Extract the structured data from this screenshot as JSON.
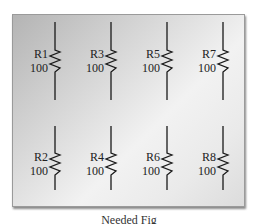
{
  "diagram": {
    "type": "circuit-schematic",
    "resistors": [
      {
        "id": "R1",
        "value": "100",
        "row": 0,
        "col": 0
      },
      {
        "id": "R3",
        "value": "100",
        "row": 0,
        "col": 1
      },
      {
        "id": "R5",
        "value": "100",
        "row": 0,
        "col": 2
      },
      {
        "id": "R7",
        "value": "100",
        "row": 0,
        "col": 3
      },
      {
        "id": "R2",
        "value": "100",
        "row": 1,
        "col": 0
      },
      {
        "id": "R4",
        "value": "100",
        "row": 1,
        "col": 1
      },
      {
        "id": "R6",
        "value": "100",
        "row": 1,
        "col": 2
      },
      {
        "id": "R8",
        "value": "100",
        "row": 1,
        "col": 3
      }
    ],
    "caption": "Needed Fig"
  },
  "labels": {
    "r1": "R1",
    "r1v": "100",
    "r3": "R3",
    "r3v": "100",
    "r5": "R5",
    "r5v": "100",
    "r7": "R7",
    "r7v": "100",
    "r2": "R2",
    "r2v": "100",
    "r4": "R4",
    "r4v": "100",
    "r6": "R6",
    "r6v": "100",
    "r8": "R8",
    "r8v": "100"
  }
}
